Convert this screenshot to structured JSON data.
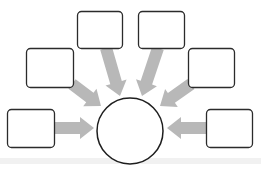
{
  "diagram": {
    "type": "hub-and-spoke",
    "title": "",
    "colors": {
      "background": "#ffffff",
      "box_stroke": "#2b2b2b",
      "box_fill": "#ffffff",
      "circle_stroke": "#1e1e1e",
      "circle_fill": "#ffffff",
      "arrow_fill": "#b8b8b8",
      "floor_shade": "#ececec"
    },
    "center": {
      "shape": "circle",
      "label": "",
      "cx": 130,
      "cy": 131,
      "r": 33
    },
    "boxes": [
      {
        "id": "box-top-left",
        "label": "",
        "x": 77,
        "y": 11,
        "w": 45,
        "h": 37
      },
      {
        "id": "box-top-right",
        "label": "",
        "x": 138,
        "y": 11,
        "w": 46,
        "h": 37
      },
      {
        "id": "box-mid-left",
        "label": "",
        "x": 26,
        "y": 48,
        "w": 47,
        "h": 39
      },
      {
        "id": "box-mid-right",
        "label": "",
        "x": 188,
        "y": 48,
        "w": 46,
        "h": 39
      },
      {
        "id": "box-bottom-left",
        "label": "",
        "x": 7,
        "y": 109,
        "w": 47,
        "h": 38
      },
      {
        "id": "box-bottom-right",
        "label": "",
        "x": 206,
        "y": 109,
        "w": 46,
        "h": 38
      }
    ],
    "arrows": [
      {
        "from": "box-top-left",
        "to": "center",
        "x1": 106,
        "y1": 48,
        "x2": 120,
        "y2": 96
      },
      {
        "from": "box-top-right",
        "to": "center",
        "x1": 158,
        "y1": 48,
        "x2": 142,
        "y2": 96
      },
      {
        "from": "box-mid-left",
        "to": "center",
        "x1": 72,
        "y1": 84,
        "x2": 101,
        "y2": 106
      },
      {
        "from": "box-mid-right",
        "to": "center",
        "x1": 191,
        "y1": 84,
        "x2": 160,
        "y2": 106
      },
      {
        "from": "box-bottom-left",
        "to": "center",
        "x1": 54,
        "y1": 128,
        "x2": 94,
        "y2": 128
      },
      {
        "from": "box-bottom-right",
        "to": "center",
        "x1": 206,
        "y1": 128,
        "x2": 167,
        "y2": 128
      }
    ]
  }
}
